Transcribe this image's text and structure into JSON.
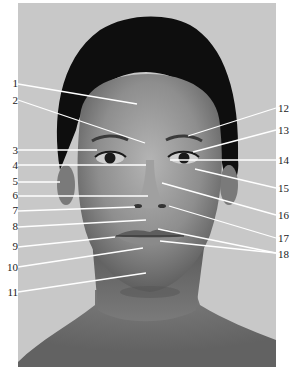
{
  "figure": {
    "type": "anatomical-face-diagram",
    "background_color": "#ffffff",
    "photo_bg_color": "#c8c8c8",
    "leader_line_color": "#ffffff"
  },
  "labels": [
    {
      "id": "1",
      "side": "left",
      "text": "1",
      "tx": 2,
      "ty": 78,
      "line": [
        [
          18,
          84
        ],
        [
          137,
          104
        ]
      ]
    },
    {
      "id": "2",
      "side": "left",
      "text": "2",
      "tx": 2,
      "ty": 95,
      "line": [
        [
          18,
          100
        ],
        [
          145,
          143
        ]
      ]
    },
    {
      "id": "3",
      "side": "left",
      "text": "3",
      "tx": 2,
      "ty": 145,
      "line": [
        [
          18,
          150
        ],
        [
          97,
          150
        ]
      ]
    },
    {
      "id": "4",
      "side": "left",
      "text": "4",
      "tx": 2,
      "ty": 160,
      "line": [
        [
          18,
          165
        ],
        [
          146,
          165
        ]
      ]
    },
    {
      "id": "5",
      "side": "left",
      "text": "5",
      "tx": 2,
      "ty": 176,
      "line": [
        [
          18,
          182
        ],
        [
          60,
          182
        ]
      ]
    },
    {
      "id": "6",
      "side": "left",
      "text": "6",
      "tx": 2,
      "ty": 190,
      "line": [
        [
          18,
          196
        ],
        [
          148,
          196
        ]
      ]
    },
    {
      "id": "7",
      "side": "left",
      "text": "7",
      "tx": 2,
      "ty": 205,
      "line": [
        [
          18,
          211
        ],
        [
          135,
          207
        ]
      ]
    },
    {
      "id": "8",
      "side": "left",
      "text": "8",
      "tx": 2,
      "ty": 221,
      "line": [
        [
          18,
          227
        ],
        [
          146,
          220
        ]
      ]
    },
    {
      "id": "9",
      "side": "left",
      "text": "9",
      "tx": 2,
      "ty": 241,
      "line": [
        [
          18,
          247
        ],
        [
          115,
          237
        ]
      ]
    },
    {
      "id": "10",
      "side": "left",
      "text": "10",
      "tx": 2,
      "ty": 262,
      "line": [
        [
          18,
          267
        ],
        [
          143,
          248
        ]
      ]
    },
    {
      "id": "11",
      "side": "left",
      "text": "11",
      "tx": 2,
      "ty": 287,
      "line": [
        [
          18,
          292
        ],
        [
          146,
          273
        ]
      ]
    },
    {
      "id": "12",
      "side": "right",
      "text": "12",
      "tx": 278,
      "ty": 103,
      "line": [
        [
          276,
          108
        ],
        [
          188,
          136
        ]
      ]
    },
    {
      "id": "13",
      "side": "right",
      "text": "13",
      "tx": 278,
      "ty": 125,
      "line": [
        [
          276,
          130
        ],
        [
          193,
          152
        ]
      ]
    },
    {
      "id": "14",
      "side": "right",
      "text": "14",
      "tx": 278,
      "ty": 155,
      "line": [
        [
          276,
          160
        ],
        [
          170,
          160
        ]
      ]
    },
    {
      "id": "15",
      "side": "right",
      "text": "15",
      "tx": 278,
      "ty": 183,
      "line": [
        [
          276,
          188
        ],
        [
          195,
          169
        ]
      ]
    },
    {
      "id": "16",
      "side": "right",
      "text": "16",
      "tx": 278,
      "ty": 210,
      "line": [
        [
          276,
          215
        ],
        [
          162,
          183
        ]
      ]
    },
    {
      "id": "17",
      "side": "right",
      "text": "17",
      "tx": 278,
      "ty": 233,
      "line": [
        [
          276,
          238
        ],
        [
          169,
          206
        ]
      ]
    },
    {
      "id": "18",
      "side": "right",
      "text": "18",
      "tx": 278,
      "ty": 249,
      "line": [
        [
          276,
          253
        ],
        [
          158,
          229
        ]
      ],
      "line2": [
        [
          276,
          253
        ],
        [
          160,
          241
        ]
      ]
    }
  ]
}
